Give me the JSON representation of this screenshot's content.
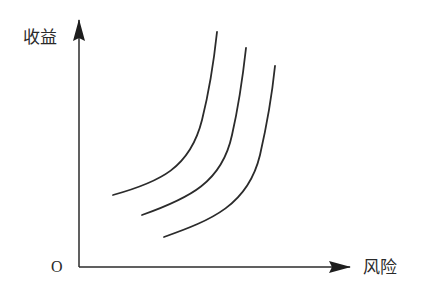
{
  "diagram": {
    "title": "",
    "y_axis_label": "收益",
    "x_axis_label": "风险",
    "origin_label": "O",
    "line_color": "#2b2b2b",
    "axes": {
      "origin": [
        79,
        267
      ],
      "y_end": [
        79,
        20
      ],
      "x_end": [
        350,
        267
      ]
    },
    "curves": [
      {
        "name": "curve-1",
        "d": "M113,195 C160,182 190,168 202,120 C210,88 214,60 217,32"
      },
      {
        "name": "curve-2",
        "d": "M142,215 C190,198 222,182 232,135 C240,100 243,75 246,48"
      },
      {
        "name": "curve-3",
        "d": "M164,237 C212,220 248,205 260,155 C268,120 272,95 275,66"
      }
    ]
  }
}
